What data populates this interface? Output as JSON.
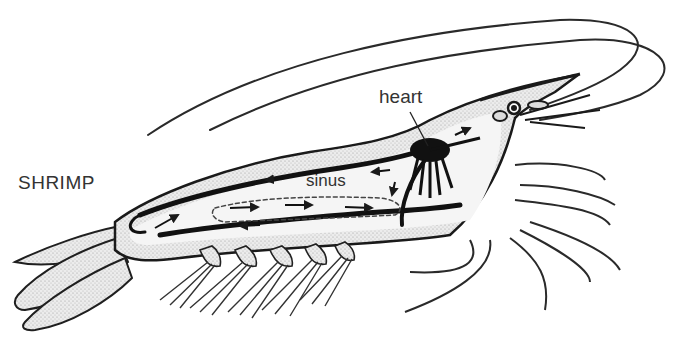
{
  "diagram": {
    "title": "SHRIMP",
    "labels": {
      "heart": "heart",
      "sinus": "sinus"
    },
    "colors": {
      "background": "#ffffff",
      "ink": "#1a1a1a",
      "shading": "#bdbdbd",
      "body_fill": "#e9e9e9",
      "label_text": "#333333"
    }
  }
}
